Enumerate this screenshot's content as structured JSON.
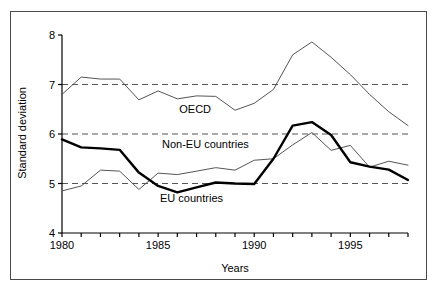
{
  "figure": {
    "border_color": "#4a4a4a",
    "background": "#ffffff"
  },
  "chart_data": {
    "type": "line",
    "title": "",
    "xlabel": "Years",
    "ylabel": "Standard deviation",
    "xlim": [
      1980,
      1998
    ],
    "ylim": [
      4,
      8
    ],
    "yticks": [
      4,
      5,
      6,
      7,
      8
    ],
    "ytick_labels": [
      "4",
      "5",
      "6",
      "7",
      "8"
    ],
    "xticks": [
      1980,
      1981,
      1982,
      1983,
      1984,
      1985,
      1986,
      1987,
      1988,
      1989,
      1990,
      1991,
      1992,
      1993,
      1994,
      1995,
      1996,
      1997,
      1998
    ],
    "xtick_labels_shown": [
      "1980",
      "1985",
      "1990",
      "1995"
    ],
    "xtick_labels_shown_values": [
      1980,
      1985,
      1990,
      1995
    ],
    "gridlines": {
      "y": [
        5,
        6,
        7
      ],
      "style": "dashed",
      "color": "#555555"
    },
    "legend": "inline-annotations",
    "x": [
      1980,
      1981,
      1982,
      1983,
      1984,
      1985,
      1986,
      1987,
      1988,
      1989,
      1990,
      1991,
      1992,
      1993,
      1994,
      1995,
      1996,
      1997,
      1998
    ],
    "series": [
      {
        "name": "OECD",
        "color": "#555555",
        "linewidth": 1,
        "label_x": 1986.1,
        "label_y": 6.42,
        "values": [
          6.8,
          7.15,
          7.11,
          7.11,
          6.69,
          6.87,
          6.71,
          6.77,
          6.76,
          6.48,
          6.62,
          6.9,
          7.6,
          7.86,
          7.55,
          7.2,
          6.8,
          6.45,
          6.17
        ]
      },
      {
        "name": "Non-EU countries",
        "color": "#555555",
        "linewidth": 1,
        "label_x": 1985.2,
        "label_y": 5.72,
        "values": [
          4.85,
          4.95,
          5.27,
          5.25,
          4.88,
          5.21,
          5.18,
          5.25,
          5.32,
          5.27,
          5.47,
          5.5,
          5.78,
          6.03,
          5.67,
          5.77,
          5.33,
          5.45,
          5.37
        ]
      },
      {
        "name": "EU countries",
        "color": "#000000",
        "linewidth": 2.4,
        "label_x": 1985.1,
        "label_y": 4.62,
        "values": [
          5.89,
          5.73,
          5.71,
          5.68,
          5.22,
          4.95,
          4.82,
          4.92,
          5.02,
          5.0,
          4.99,
          5.5,
          6.17,
          6.24,
          5.98,
          5.43,
          5.34,
          5.28,
          5.07
        ]
      }
    ]
  }
}
